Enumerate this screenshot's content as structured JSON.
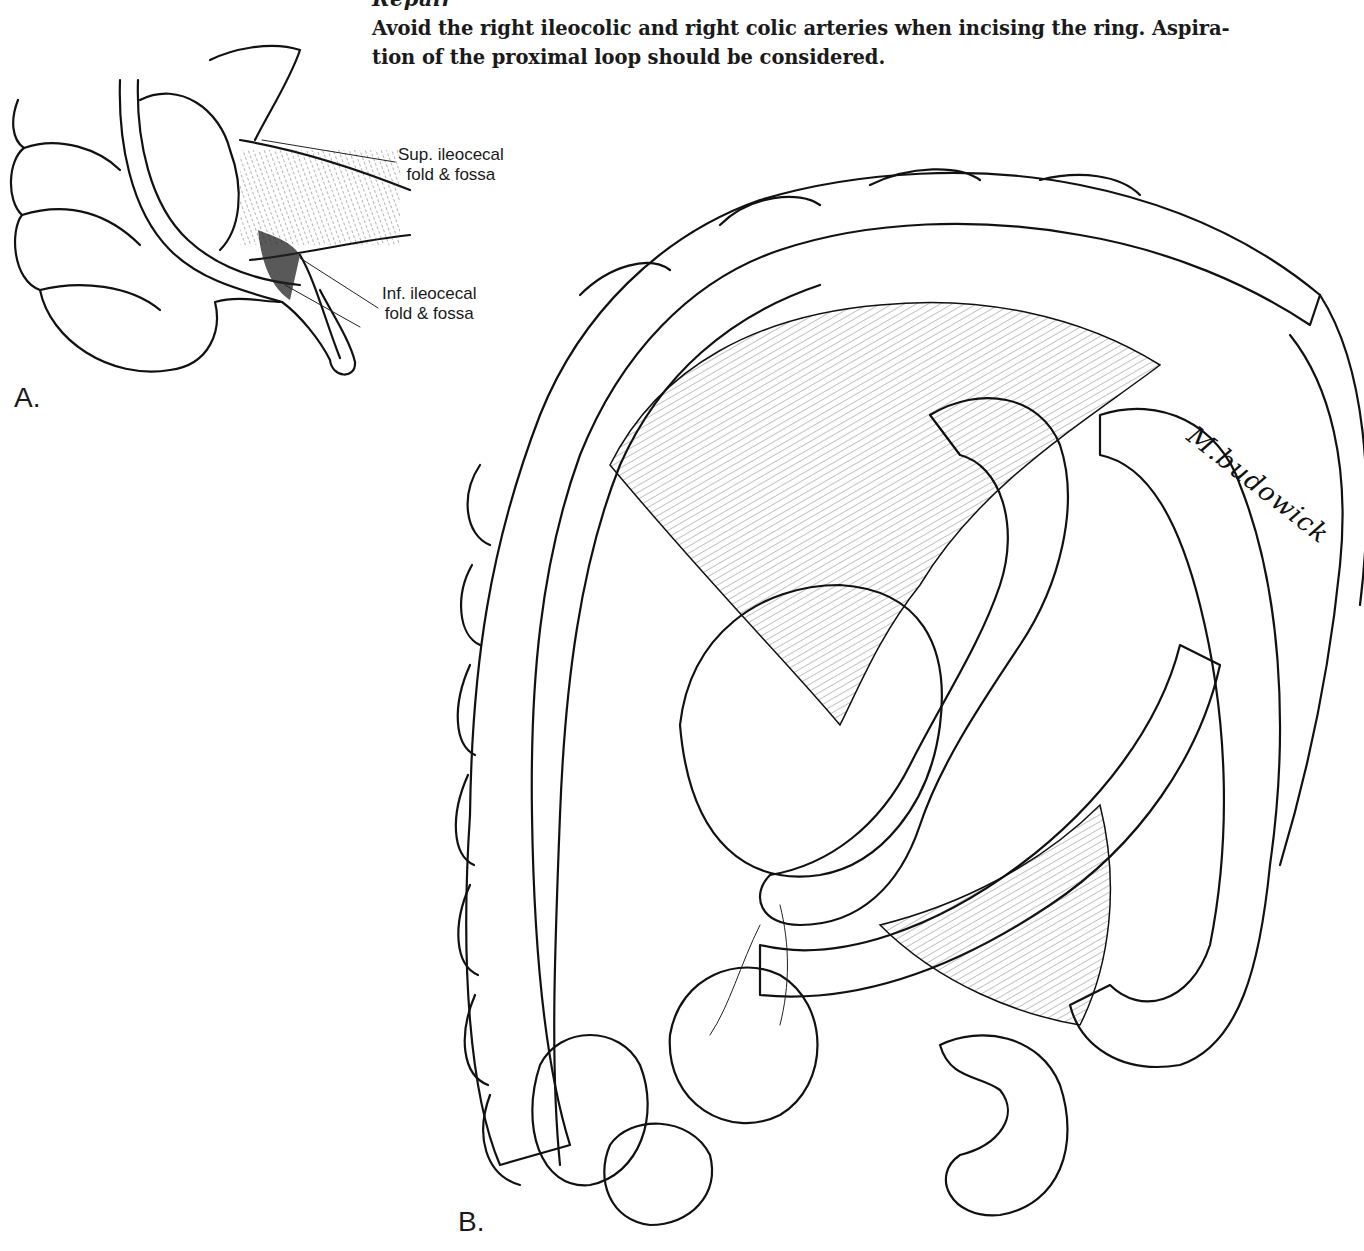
{
  "page": {
    "heading_partial": "Repair",
    "paragraph_lines": [
      "Avoid the right ileocolic and right colic arteries when incising the ring. Aspira-",
      "tion of the proximal loop should be considered."
    ]
  },
  "figure_a": {
    "label": "A.",
    "callouts": [
      {
        "line1": "Sup. ileocecal",
        "line2": "fold & fossa"
      },
      {
        "line1": "Inf. ileocecal",
        "line2": "fold & fossa"
      }
    ]
  },
  "figure_b": {
    "label": "B.",
    "signature": "M.budowick"
  },
  "colors": {
    "ink": "#111111",
    "paper": "#ffffff"
  }
}
